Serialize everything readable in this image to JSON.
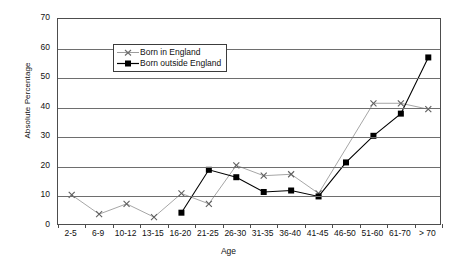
{
  "chart_data": {
    "type": "line",
    "title": "",
    "xlabel": "Age",
    "ylabel": "Absolute Percentage",
    "ylim": [
      0,
      70
    ],
    "ytick_step": 10,
    "yticks": [
      70,
      60,
      50,
      40,
      30,
      20,
      10,
      0
    ],
    "grid": true,
    "legend_position": "upper-left-inside",
    "categories": [
      "2-5",
      "6-9",
      "10-12",
      "13-15",
      "16-20",
      "21-25",
      "26-30",
      "31-35",
      "36-40",
      "41-45",
      "46-50",
      "51-60",
      "61-70",
      "> 70"
    ],
    "series": [
      {
        "name": "Born in England",
        "color": "#9c9c9c",
        "marker": "x",
        "values": [
          10.5,
          4.0,
          7.5,
          3.0,
          11.0,
          7.5,
          20.5,
          17.0,
          17.5,
          11.0,
          null,
          41.5,
          41.5,
          39.5
        ]
      },
      {
        "name": "Born outside England",
        "color": "#000000",
        "marker": "square",
        "values": [
          null,
          null,
          null,
          null,
          4.5,
          19.0,
          16.5,
          11.5,
          12.0,
          10.0,
          21.5,
          30.5,
          38.0,
          57.0
        ]
      }
    ]
  },
  "axes": {
    "y_title": "Absolute Percentage",
    "x_title": "Age"
  },
  "legend": {
    "items": [
      {
        "label": "Born in England"
      },
      {
        "label": "Born outside England"
      }
    ]
  }
}
